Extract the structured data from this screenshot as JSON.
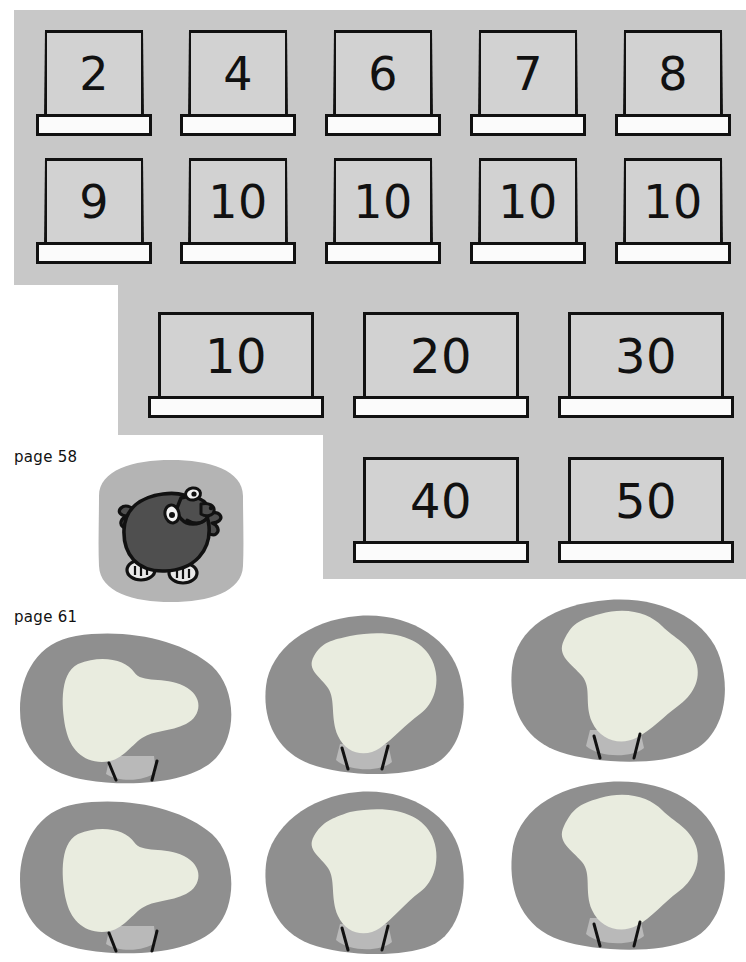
{
  "palette": {
    "page_background": "#ffffff",
    "panel_grey": "#c8c8c8",
    "card_face": "#d2d2d2",
    "card_base": "#fbfbfb",
    "ink": "#111111",
    "mole_tile_grey": "#b4b4b4",
    "mole_body": "#4f4f4f",
    "rock_outer_grey": "#8f8f8f",
    "rock_inner_light": "#e9ecdf",
    "rock_shadow_grey": "#b9b9b9"
  },
  "panels": {
    "top": {
      "name": "number-cards-panel-top",
      "rows": [
        {
          "cards": [
            {
              "value": "2"
            },
            {
              "value": "4"
            },
            {
              "value": "6"
            },
            {
              "value": "7"
            },
            {
              "value": "8"
            }
          ]
        },
        {
          "cards": [
            {
              "value": "9"
            },
            {
              "value": "10"
            },
            {
              "value": "10"
            },
            {
              "value": "10"
            },
            {
              "value": "10"
            }
          ]
        }
      ]
    },
    "middle_upper": {
      "name": "number-cards-panel-middle-upper",
      "cards": [
        {
          "value": "10"
        },
        {
          "value": "20"
        },
        {
          "value": "30"
        }
      ]
    },
    "middle_lower": {
      "name": "number-cards-panel-middle-lower",
      "cards": [
        {
          "value": "40"
        },
        {
          "value": "50"
        }
      ]
    }
  },
  "labels": {
    "page_58": "page 58",
    "page_61": "page 61"
  },
  "illustrations": {
    "mole": {
      "name": "mole-illustration",
      "caption": "page 58"
    },
    "rocks": {
      "name": "rock-cards",
      "caption": "page 61",
      "count": 6,
      "items": [
        {
          "id": "rock-1",
          "row": 1,
          "col": 1
        },
        {
          "id": "rock-2",
          "row": 1,
          "col": 2
        },
        {
          "id": "rock-3",
          "row": 1,
          "col": 3
        },
        {
          "id": "rock-4",
          "row": 2,
          "col": 1
        },
        {
          "id": "rock-5",
          "row": 2,
          "col": 2
        },
        {
          "id": "rock-6",
          "row": 2,
          "col": 3
        }
      ]
    }
  }
}
